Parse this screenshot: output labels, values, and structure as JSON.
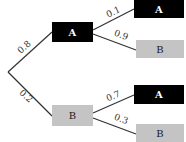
{
  "diagram": {
    "type": "probability-tree",
    "colors": {
      "event_a_fill": "#000000",
      "event_a_text": "#ffffff",
      "event_b_fill": "#c4c4c4",
      "event_b_text": "#222222",
      "edge": "#333333"
    },
    "level1": [
      {
        "label": "A",
        "probability": "0.8"
      },
      {
        "label": "B",
        "probability": "0.2"
      }
    ],
    "level2": [
      {
        "parent": "A",
        "label": "A",
        "probability": "0.1"
      },
      {
        "parent": "A",
        "label": "B",
        "probability": "0.9"
      },
      {
        "parent": "B",
        "label": "A",
        "probability": "0.7"
      },
      {
        "parent": "B",
        "label": "B",
        "probability": "0.3"
      }
    ]
  }
}
